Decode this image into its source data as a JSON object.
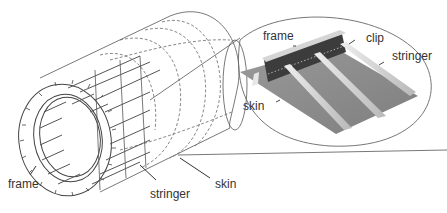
{
  "figure": {
    "overview": {
      "labels": {
        "frame": "frame",
        "stringer": "stringer",
        "skin": "skin"
      }
    },
    "detail": {
      "labels": {
        "frame": "frame",
        "clip": "clip",
        "stringer": "stringer",
        "skin": "skin"
      }
    },
    "colors": {
      "line": "#4a4a4a",
      "dashed": "#6a6a6a",
      "skin_panel": "#8e8e8e",
      "skin_panel_light": "#b5b5b5",
      "frame_dark": "#3c3c3c",
      "stringer_light": "#d8d8d8",
      "text": "#333333"
    }
  }
}
